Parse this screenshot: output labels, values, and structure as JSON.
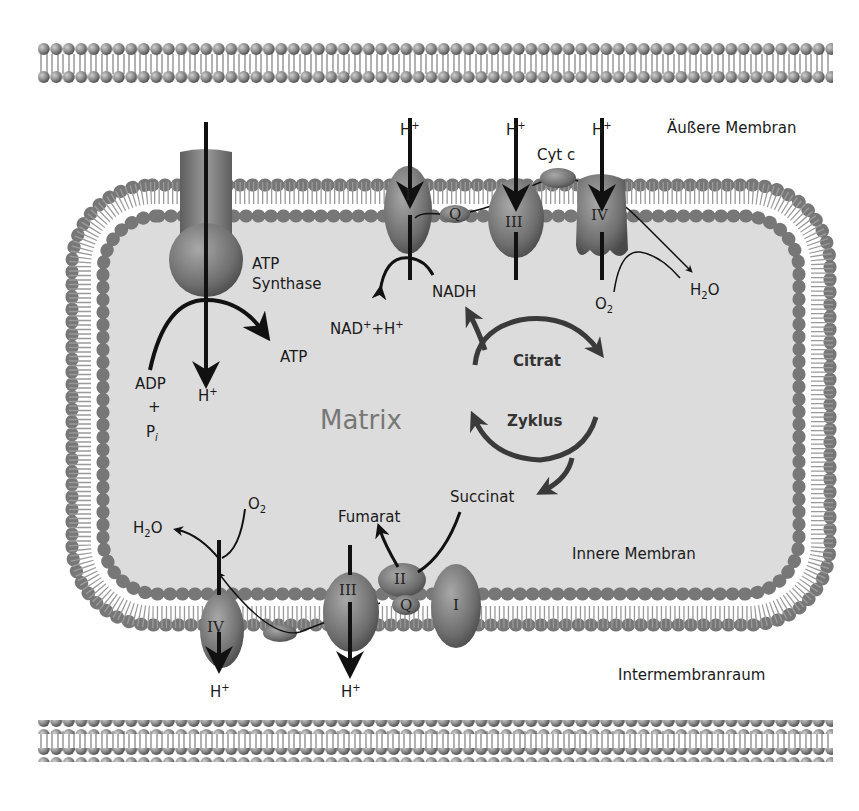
{
  "colors": {
    "background": "#ffffff",
    "matrix_fill": "#dcdcdc",
    "lipid_head": "#8a8a8a",
    "protein": "#7a7a7a",
    "arrow": "#111111",
    "citrat_arrow": "#3a3a3a",
    "matrix_label": "#777777"
  },
  "labels": {
    "outer_membrane": "Äußere Membran",
    "inner_membrane": "Innere Membran",
    "intermembrane_space": "Intermembranraum",
    "matrix": "Matrix",
    "atp_synthase_line1": "ATP",
    "atp_synthase_line2": "Synthase",
    "atp": "ATP",
    "adp": "ADP",
    "plus": "+",
    "pi": "P",
    "pi_sub": "i",
    "h": "H",
    "h_sup": "+",
    "nadh": "NADH",
    "nad_plus_h": "NAD",
    "nad_sup": "+",
    "nad_mid": "+H",
    "cyt_c": "Cyt c",
    "o2": "O",
    "o2_sub": "2",
    "h2o_h": "H",
    "h2o_sub": "2",
    "h2o_o": "O",
    "citrat": "Citrat",
    "zyklus": "Zyklus",
    "succinat": "Succinat",
    "fumarat": "Fumarat"
  },
  "complexes": {
    "top": [
      "I",
      "Q",
      "III",
      "IV"
    ],
    "bottom": [
      "IV",
      "III",
      "II",
      "Q",
      "I"
    ]
  }
}
